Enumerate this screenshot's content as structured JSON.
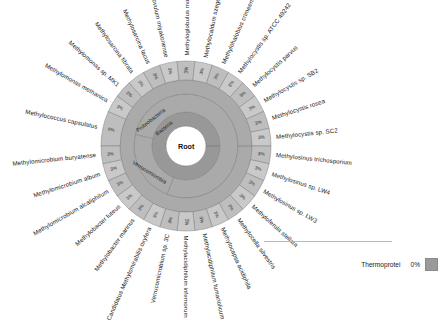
{
  "chart_data": {
    "type": "pie",
    "title": "",
    "center_label": "Root",
    "inner_rings": [
      {
        "label": "Bacteria",
        "value": 100
      },
      {
        "label": "Proteobacteria",
        "value": 75
      },
      {
        "label": "Verrucomicrobia",
        "value": 12
      }
    ],
    "categories": [
      "Methylococcus capsulatus",
      "Methylomonas methanica",
      "Methylomonas sp. MK1",
      "Methylosarcina fibrata",
      "Methylosarcina lacus",
      "Methylovulum miyakonense",
      "Methyloglobulus morosus",
      "Methylocaldum szegediense",
      "Methylohalobius crimeensis",
      "Methylocystis sp. ATCC 49242",
      "Methylocystis parvus",
      "Methylocystis sp. SB2",
      "Methylocystis rosea",
      "Methylocystis sp. SC2",
      "Methylosinus trichosporium",
      "Methylosinus sp. LW4",
      "Methylosinus sp. LW3",
      "Methyloferula stellata",
      "Methylocella silvestris",
      "Methylocapsa acidiphila",
      "Methylacidiphilum fumariolicum",
      "Methylacidiphilum infernorum",
      "Verrucomicrobium sp. 3C",
      "Candidatus Methylomirabilis oxyfera",
      "Methylobacter marinus",
      "Methylobacter luteus",
      "Methylomicrobium alcaliphilum",
      "Methylomicrobium album",
      "Methylomicrobium buryatense"
    ],
    "values": [
      6,
      3,
      3,
      3,
      3,
      3,
      3,
      3,
      3,
      3,
      3,
      3,
      3,
      3,
      3,
      3,
      3,
      3,
      3,
      3,
      3,
      3,
      3,
      3,
      3,
      3,
      3,
      3,
      3
    ],
    "value_labels": [
      "6%",
      "3%",
      "3%",
      "3%",
      "3%",
      "3%",
      "3%",
      "3%",
      "3%",
      "3%",
      "3%",
      "3%",
      "3%",
      "3%",
      "3%",
      "3%",
      "3%",
      "3%",
      "3%",
      "3%",
      "3%",
      "3%",
      "3%",
      "3%",
      "3%",
      "3%",
      "3%",
      "3%",
      "3%"
    ],
    "xlabel": "",
    "ylabel": "",
    "legend_position": "bottom-right",
    "grid": false
  },
  "legend": {
    "label": "Thermoprotei",
    "value": "0%",
    "swatch_color": "#9a9a9a"
  },
  "colors": {
    "ring_outer": "#c3c3c3",
    "ring_mid": "#aaaaaa",
    "ring_inner": "#989898",
    "center": "#ffffff",
    "stroke": "#7e7e7e",
    "text": "#1a1a1a"
  }
}
